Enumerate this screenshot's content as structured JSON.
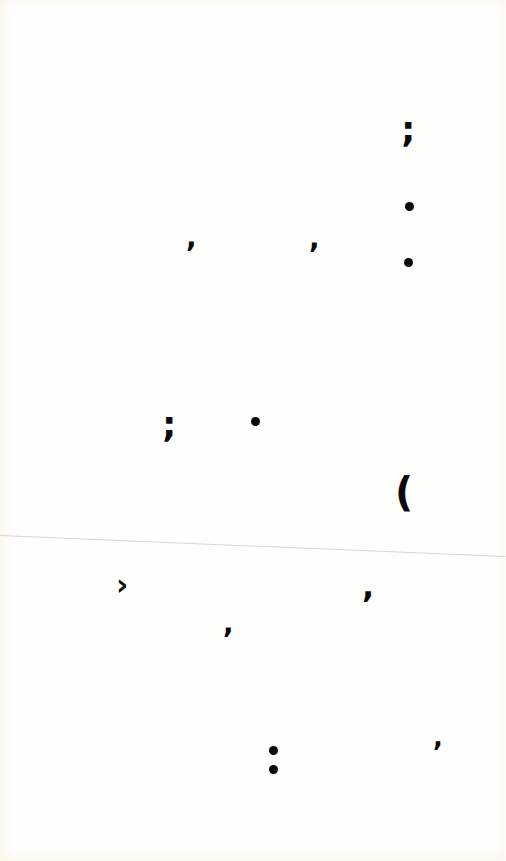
{
  "page": {
    "background_color": "#fefefd",
    "ink_color": "#0a0a0a",
    "fold_line_color": "#d9d6c8"
  },
  "marks": [
    {
      "id": "semicolon-top-right",
      "glyph": ";",
      "x": 410,
      "y": 135
    },
    {
      "id": "period-right-1",
      "glyph": "•",
      "x": 409,
      "y": 206
    },
    {
      "id": "comma-left-upper",
      "glyph": ",",
      "x": 191,
      "y": 243
    },
    {
      "id": "comma-mid-upper",
      "glyph": ",",
      "x": 314,
      "y": 244
    },
    {
      "id": "period-right-2",
      "glyph": "•",
      "x": 408,
      "y": 262
    },
    {
      "id": "semicolon-left-middle",
      "glyph": ";",
      "x": 171,
      "y": 428
    },
    {
      "id": "period-middle",
      "glyph": "•",
      "x": 255,
      "y": 421
    },
    {
      "id": "open-paren-right",
      "glyph": "(",
      "x": 404,
      "y": 493
    },
    {
      "id": "chevron-left-lower",
      "glyph": "›",
      "x": 123,
      "y": 586
    },
    {
      "id": "comma-right-lower",
      "glyph": ",",
      "x": 368,
      "y": 591
    },
    {
      "id": "comma-mid-lower",
      "glyph": ",",
      "x": 228,
      "y": 628
    },
    {
      "id": "colon-bottom",
      "glyph": ":",
      "x": 273,
      "y": 759
    },
    {
      "id": "comma-bottom-right",
      "glyph": ",",
      "x": 437,
      "y": 742
    }
  ]
}
